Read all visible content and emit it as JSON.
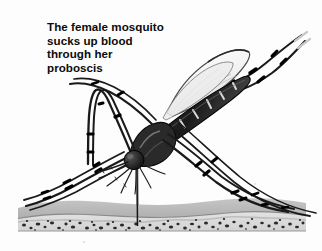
{
  "image": {
    "kind": "scientific-illustration",
    "subject": "female mosquito feeding on skin",
    "width": 322,
    "height": 251,
    "background_color": "#fdfdfd",
    "ink_color": "#111111"
  },
  "caption": {
    "lines": [
      "The female mosquito",
      "sucks up blood",
      "through her",
      "proboscis"
    ],
    "text_color": "#0b0b0b",
    "style": "bold"
  },
  "anatomy": {
    "head_label": "head",
    "proboscis_label": "proboscis",
    "abdomen_label": "banded abdomen",
    "wing_label": "wing",
    "thorax_label": "thorax",
    "legs_label": "banded legs",
    "palps_label": "palps"
  },
  "skin": {
    "layers": [
      {
        "name": "epidermis",
        "color": "#b9b9b9"
      },
      {
        "name": "basal-line",
        "color": "#8a8a8a"
      },
      {
        "name": "dermis",
        "color": "#dcdcdc"
      },
      {
        "name": "dermis-speckles",
        "color": "#2e2e2e"
      }
    ],
    "left_edge": 18,
    "right_edge": 306,
    "top": 200,
    "bottom": 231
  },
  "colors": {
    "ink": "#111111",
    "mid_gray": "#6e6e6e",
    "light_gray": "#b9b9b9",
    "pale": "#e4e4e4",
    "white": "#ffffff"
  }
}
